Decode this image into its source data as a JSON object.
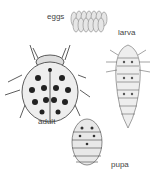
{
  "diagram": {
    "stages": [
      {
        "id": "eggs",
        "label": "eggs"
      },
      {
        "id": "larva",
        "label": "larva"
      },
      {
        "id": "adult",
        "label": "adult"
      },
      {
        "id": "pupa",
        "label": "pupa"
      }
    ]
  }
}
